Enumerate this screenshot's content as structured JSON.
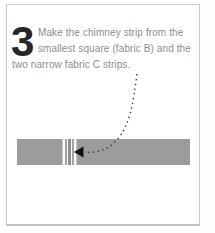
{
  "step": {
    "number": "3",
    "instruction": "Make the chimney strip from the smallest square (fabric B) and the two narrow fabric C strips.",
    "line1": "Make the chimney strip from the",
    "line2": "smallest square (fabric B) and the",
    "line3": "two narrow fabric C strips."
  },
  "illustration": {
    "strip_color": "#9c9c9c",
    "stripe_white": "#f9f9f9",
    "stripe_light": "#c6c6c6",
    "stripe_mid": "#a2a2a2",
    "stripe_dark": "#8e8e8e",
    "arrow_dot_color": "#3a3a3a",
    "arrowhead_color": "#111111"
  },
  "colors": {
    "card_border": "#c9c9c9",
    "text": "#8d8d8d",
    "step_number": "#262626",
    "background": "#ffffff"
  }
}
